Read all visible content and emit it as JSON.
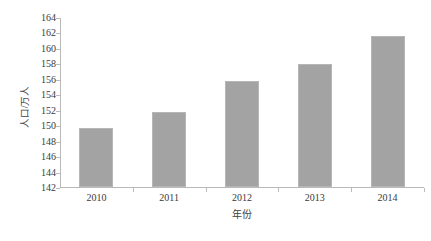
{
  "chart_data": {
    "type": "bar",
    "title": "",
    "subtitle": "",
    "xlabel": "年份",
    "ylabel": "人口/万人",
    "categories": [
      "2010",
      "2011",
      "2012",
      "2013",
      "2014"
    ],
    "values": [
      149.6,
      151.7,
      155.7,
      157.9,
      161.6
    ],
    "series": [
      {
        "name": "人口/万人",
        "values": [
          149.6,
          151.7,
          155.7,
          157.9,
          161.6
        ]
      }
    ],
    "ylim": [
      142,
      164
    ],
    "ytick_step": 2,
    "ytick_labels": [
      "142",
      "144",
      "146",
      "148",
      "150",
      "152",
      "154",
      "156",
      "158",
      "160",
      "162",
      "164"
    ],
    "ytick_values": [
      142,
      144,
      146,
      148,
      150,
      152,
      154,
      156,
      158,
      160,
      162,
      164
    ],
    "xtick_labels": [
      "2010",
      "2011",
      "2012",
      "2013",
      "2014"
    ],
    "grid": false,
    "legend": false,
    "legend_position": "none",
    "bar_color": "#a3a3a3",
    "bar_border_color": "#b6b6b6",
    "axis_color": "#b9b9b9",
    "text_color": "#3a3a3a",
    "background_color": "#ffffff",
    "annotations": []
  }
}
